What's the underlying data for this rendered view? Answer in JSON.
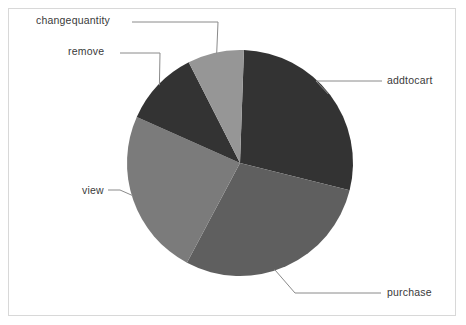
{
  "chart_data": {
    "type": "pie",
    "title": "",
    "subtitle": "",
    "xlabel": "",
    "ylabel": "",
    "grid": false,
    "legend_position": "none",
    "label_style": "external-leader-lines",
    "categories": [
      "addtocart",
      "purchase",
      "view",
      "remove",
      "changequantity"
    ],
    "values": [
      28.4,
      28.9,
      23.9,
      10.8,
      8.0
    ],
    "units": "percent",
    "colors": [
      "#333333",
      "#5f5f5f",
      "#7b7b7b",
      "#333333",
      "#969696"
    ],
    "slices": [
      {
        "label": "addtocart",
        "value": 28.4,
        "color": "#333333",
        "start_angle_deg": -88,
        "end_angle_deg": 14
      },
      {
        "label": "purchase",
        "value": 28.9,
        "color": "#5f5f5f",
        "start_angle_deg": 14,
        "end_angle_deg": 118
      },
      {
        "label": "view",
        "value": 23.9,
        "color": "#7b7b7b",
        "start_angle_deg": 118,
        "end_angle_deg": 204
      },
      {
        "label": "remove",
        "value": 10.8,
        "color": "#333333",
        "start_angle_deg": 204,
        "end_angle_deg": 243
      },
      {
        "label": "changequantity",
        "value": 8.0,
        "color": "#969696",
        "start_angle_deg": 243,
        "end_angle_deg": 272
      }
    ],
    "geometry": {
      "center_x": 240,
      "center_y": 163,
      "radius": 113
    }
  },
  "labels": {
    "changequantity": "changequantity",
    "remove": "remove",
    "view": "view",
    "addtocart": "addtocart",
    "purchase": "purchase"
  },
  "colors": {
    "frame_border": "#d8d8d8",
    "background": "#ffffff",
    "leader_line": "#8a8a8a",
    "label_text": "#3a3a3a"
  }
}
